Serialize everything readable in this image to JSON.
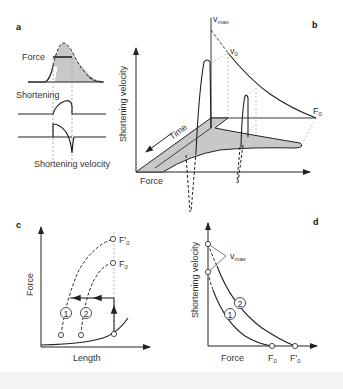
{
  "figure": {
    "panels": {
      "a": {
        "label": "a",
        "traces": {
          "force": "Force",
          "shortening": "Shortening",
          "velocity": "Shortening velocity"
        }
      },
      "b": {
        "label": "b",
        "y_axis": "Shortening velocity",
        "x_axis": "Force",
        "time_axis": "Time",
        "annotations": {
          "vmax": "v",
          "vmax_sub": "max",
          "v0": "v",
          "v0_sub": "0",
          "f0": "F",
          "f0_sub": "0"
        }
      },
      "c": {
        "label": "c",
        "y_axis": "Force",
        "x_axis": "Length",
        "curves": [
          {
            "id": "1",
            "label": "1"
          },
          {
            "id": "2",
            "label": "2"
          }
        ],
        "annotations": {
          "f0_prime": "F'",
          "f0_prime_sub": "0",
          "f0": "F",
          "f0_sub": "0"
        }
      },
      "d": {
        "label": "d",
        "y_axis": "Shortening velocity",
        "x_axis": "Force",
        "curves": [
          {
            "id": "1",
            "label": "1"
          },
          {
            "id": "2",
            "label": "2"
          }
        ],
        "annotations": {
          "vmax": "v",
          "vmax_sub": "max",
          "f0": "F",
          "f0_sub": "0",
          "f0_prime": "F'",
          "f0_prime_sub": "0"
        }
      }
    },
    "colors": {
      "line": "#222222",
      "fill": "#c8c8c8",
      "guide": "#aaaaaa"
    }
  }
}
